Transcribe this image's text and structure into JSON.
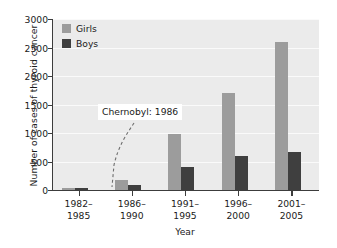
{
  "chart_data": {
    "type": "bar",
    "title": "",
    "xlabel": "Year",
    "ylabel": "Number of cases of thyroid cancer",
    "categories": [
      "1982–1985",
      "1986–1990",
      "1991–1995",
      "1996–2000",
      "2001–2005"
    ],
    "categories_lines": [
      [
        "1982–",
        "1985"
      ],
      [
        "1986–",
        "1990"
      ],
      [
        "1991–",
        "1995"
      ],
      [
        "1996–",
        "2000"
      ],
      [
        "2001–",
        "2005"
      ]
    ],
    "series": [
      {
        "name": "Girls",
        "color": "#9c9c9c",
        "values": [
          20,
          180,
          980,
          1700,
          2600
        ]
      },
      {
        "name": "Boys",
        "color": "#3f3f3f",
        "values": [
          10,
          80,
          400,
          590,
          670
        ]
      }
    ],
    "ylim": [
      0,
      3000
    ],
    "yticks": [
      0,
      500,
      1000,
      1500,
      2000,
      2500,
      3000
    ],
    "ytick_labels": [
      "0",
      "500",
      "1000",
      "1500",
      "2000",
      "2500",
      "3000"
    ],
    "grid": "horizontal",
    "gridline_color": "#fafafa",
    "plot_background": "#ebebeb",
    "legend_position": "top-left",
    "annotations": [
      {
        "text": "Chernobyl: 1986",
        "leader": "dashed"
      }
    ]
  }
}
